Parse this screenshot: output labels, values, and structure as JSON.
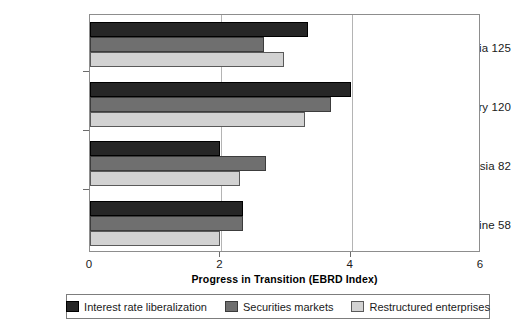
{
  "chart_data": {
    "type": "bar",
    "orientation": "horizontal",
    "title": "",
    "xlabel": "Progress in Transition (EBRD Index)",
    "ylabel": "",
    "xlim": [
      0,
      6
    ],
    "xticks": [
      0,
      2,
      4,
      6
    ],
    "xtick_labels": [
      "0",
      "2",
      "4",
      "6"
    ],
    "grid": "vertical gridlines at 2 and 4",
    "legend_position": "bottom",
    "categories": [
      "Slovenia 125",
      "Hungary 120",
      "Russia 82",
      "Ukraine 58"
    ],
    "series": [
      {
        "name": "Interest rate liberalization",
        "color": "#262626",
        "values": [
          3.35,
          4.0,
          2.0,
          2.35
        ]
      },
      {
        "name": "Securities markets",
        "color": "#6f6f6f",
        "values": [
          2.67,
          3.7,
          2.7,
          2.35
        ]
      },
      {
        "name": "Restructured enterprises",
        "color": "#d2d2d2",
        "values": [
          2.98,
          3.3,
          2.3,
          2.0
        ]
      }
    ]
  },
  "axis": {
    "x_title": "Progress in Transition (EBRD Index)",
    "tick_labels": [
      "0",
      "2",
      "4",
      "6"
    ]
  },
  "categories": [
    {
      "label": "Slovenia 125"
    },
    {
      "label": "Hungary 120"
    },
    {
      "label": "Russia 82"
    },
    {
      "label": "Ukraine 58"
    }
  ],
  "legend": {
    "items": [
      {
        "label": "Interest rate liberalization",
        "color": "#262626"
      },
      {
        "label": "Securities markets",
        "color": "#6f6f6f"
      },
      {
        "label": "Restructured enterprises",
        "color": "#d2d2d2"
      }
    ]
  }
}
